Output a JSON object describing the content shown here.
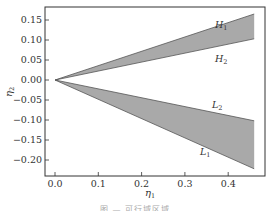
{
  "chart_data": {
    "type": "area",
    "title": "",
    "xlabel": "η1",
    "ylabel": "η2",
    "xlim": [
      -0.02,
      0.48
    ],
    "ylim": [
      -0.24,
      0.185
    ],
    "xticks": [
      0.0,
      0.1,
      0.2,
      0.3,
      0.4
    ],
    "xtick_labels": [
      "0.0",
      "0.1",
      "0.2",
      "0.3",
      "0.4"
    ],
    "yticks": [
      0.15,
      0.1,
      0.05,
      0.0,
      -0.05,
      -0.1,
      -0.15,
      -0.2
    ],
    "ytick_labels": [
      "0.15",
      "0.10",
      "0.05",
      "0.00",
      "−0.05",
      "−0.10",
      "−0.15",
      "−0.20"
    ],
    "grid": false,
    "legend": "none",
    "fill_color": "#a9a9a9",
    "line_color": "#555555",
    "series": [
      {
        "name": "H1",
        "x": [
          0.0,
          0.46
        ],
        "values": [
          0.0,
          0.165
        ]
      },
      {
        "name": "H2",
        "x": [
          0.0,
          0.46
        ],
        "values": [
          0.0,
          0.103
        ]
      },
      {
        "name": "L2",
        "x": [
          0.0,
          0.46
        ],
        "values": [
          0.0,
          -0.102
        ]
      },
      {
        "name": "L1",
        "x": [
          0.0,
          0.46
        ],
        "values": [
          0.0,
          -0.222
        ]
      }
    ],
    "filled_regions": [
      {
        "between": [
          "H1",
          "H2"
        ]
      },
      {
        "between": [
          "L2",
          "L1"
        ]
      }
    ],
    "annotations": [
      {
        "text": "H1",
        "x": 0.37,
        "y": 0.135
      },
      {
        "text": "H2",
        "x": 0.37,
        "y": 0.045
      },
      {
        "text": "L2",
        "x": 0.37,
        "y": -0.075
      },
      {
        "text": "L1",
        "x": 0.37,
        "y": -0.195
      }
    ]
  },
  "labels": {
    "xlabel_main": "η",
    "xlabel_sub": "1",
    "ylabel_main": "η",
    "ylabel_sub": "2",
    "H1_main": "H",
    "H1_sub": "1",
    "H2_main": "H",
    "H2_sub": "2",
    "L1_main": "L",
    "L1_sub": "1",
    "L2_main": "L",
    "L2_sub": "2"
  },
  "caption": "图 — 可行域区域"
}
